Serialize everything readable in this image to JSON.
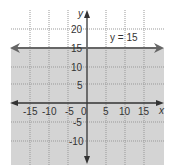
{
  "graph": {
    "equation_label": "y = 15",
    "x_axis_label": "x",
    "y_axis_label": "y",
    "x_ticks": [
      "-15",
      "-10",
      "-5",
      "0",
      "5",
      "10",
      "15"
    ],
    "y_ticks": [
      "20",
      "15",
      "10",
      "5",
      "-5",
      "-10"
    ],
    "shade_color": "#d4d4d4",
    "line_color": "#666666",
    "shaded_region": "y < 15"
  }
}
